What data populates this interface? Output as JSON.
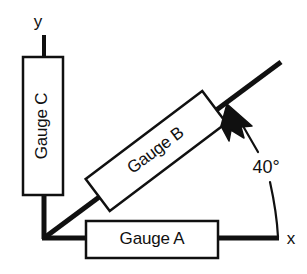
{
  "diagram": {
    "background_color": "#ffffff",
    "stroke_color": "#101010",
    "box_fill_color": "#ffffff",
    "axes": {
      "x_label": "x",
      "y_label": "y"
    },
    "gauges": [
      {
        "id": "gauge-a",
        "label": "Gauge A",
        "orientation_deg": 0,
        "text_rotation_deg": 0
      },
      {
        "id": "gauge-b",
        "label": "Gauge B",
        "orientation_deg": 40,
        "text_rotation_deg": -37
      },
      {
        "id": "gauge-c",
        "label": "Gauge C",
        "orientation_deg": 90,
        "text_rotation_deg": -90
      }
    ],
    "annotation": {
      "angle_label": "40°",
      "angle_value": 40,
      "angle_units": "degrees",
      "arrow_icon": "arrowhead-icon",
      "leader_icon": "leader-line-icon",
      "arc_icon": "angle-arc-icon"
    }
  }
}
